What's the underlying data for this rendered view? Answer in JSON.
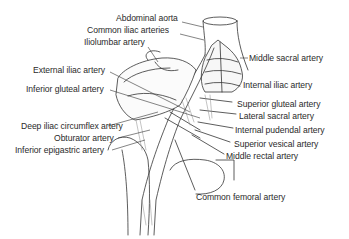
{
  "figure": {
    "line_color": "#333333",
    "text_color": "#2a2a2a",
    "background": "#ffffff"
  },
  "labels": {
    "left": [
      {
        "text": "Abdominal aorta",
        "x": 116,
        "y": 18
      },
      {
        "text": "Common iliac arteries",
        "x": 87,
        "y": 30
      },
      {
        "text": "Iliolumbar artery",
        "x": 84,
        "y": 42
      },
      {
        "text": "External iliac artery",
        "x": 33,
        "y": 67
      },
      {
        "text": "Inferior gluteal artery",
        "x": 26,
        "y": 84
      },
      {
        "text": "Deep iliac circumflex artery",
        "x": 21,
        "y": 121
      },
      {
        "text": "Obturator artery",
        "x": 54,
        "y": 133
      },
      {
        "text": "Inferior epigastric artery",
        "x": 15,
        "y": 145
      }
    ],
    "right": [
      {
        "text": "Middle sacral artery",
        "x": 249,
        "y": 53
      },
      {
        "text": "Internal iliac artery",
        "x": 243,
        "y": 80
      },
      {
        "text": "Superior gluteal artery",
        "x": 237,
        "y": 99
      },
      {
        "text": "Lateral sacral artery",
        "x": 239,
        "y": 111
      },
      {
        "text": "Internal pudendal artery",
        "x": 235,
        "y": 125
      },
      {
        "text": "Superior vesical artery",
        "x": 234,
        "y": 139
      },
      {
        "text": "Middle rectal artery",
        "x": 226,
        "y": 151
      },
      {
        "text": "Common femoral artery",
        "x": 196,
        "y": 192
      }
    ]
  }
}
